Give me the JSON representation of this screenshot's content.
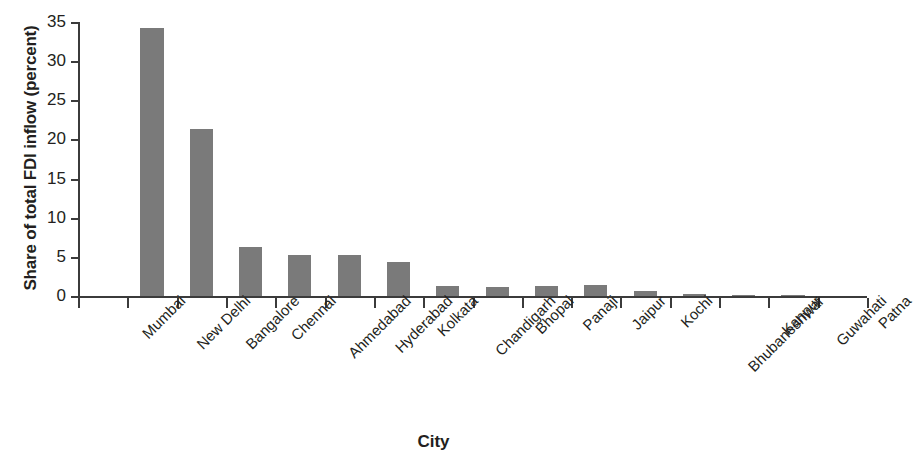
{
  "chart_data": {
    "type": "bar",
    "title": "",
    "xlabel": "City",
    "ylabel": "Share of total FDI inflow (percent)",
    "categories": [
      "Mumbai",
      "New Delhi",
      "Bangalore",
      "Chennai",
      "Ahmedabad",
      "Hyderabad",
      "Kolkata",
      "Chandigarh",
      "Bhopal",
      "Panaji",
      "Jaipur",
      "Kochi",
      "Bhubaneshwar",
      "Kanpur",
      "Guwahati",
      "Patna"
    ],
    "values": [
      34.2,
      21.3,
      6.2,
      5.2,
      5.3,
      4.3,
      1.3,
      1.2,
      1.3,
      1.4,
      0.6,
      0.2,
      0.1,
      0.1,
      0.0,
      0.0
    ],
    "ylim": [
      0,
      35
    ],
    "yticks": [
      0,
      5,
      10,
      15,
      20,
      25,
      30,
      35
    ],
    "ytick_labels": [
      "0",
      "5",
      "10",
      "15",
      "20",
      "25",
      "30",
      "35"
    ],
    "grid": false,
    "legend": null,
    "bar_color": "#7a7a7a",
    "axis_color": "#3b3b3b",
    "text_color": "#231f20",
    "bar_render_offset_slots": 1,
    "category_label_rotation_deg": -45
  }
}
